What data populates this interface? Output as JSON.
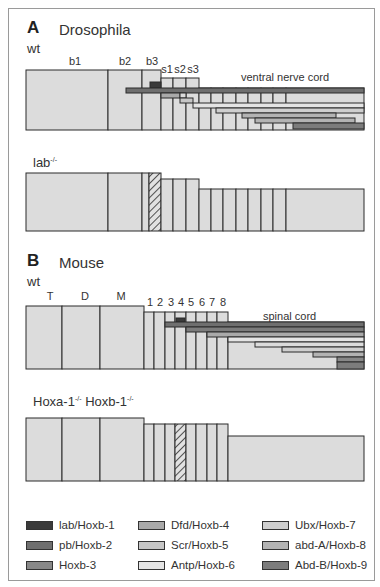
{
  "colors": {
    "segment_fill": "#dcdcdc",
    "outline": "#2b2b2b",
    "lab": "#3a3a3a",
    "pb": "#6f6f6f",
    "hoxb3": "#888888",
    "dfd": "#a9a9a9",
    "scr": "#c6c6c6",
    "antp": "#e4e4e4",
    "ubx": "#cfcfcf",
    "abdA": "#b3b3b3",
    "abdB": "#7c7c7c"
  },
  "panelA": {
    "letter": "A",
    "title": "Drosophila",
    "wt_label": "wt",
    "mutant_label": "lab",
    "mutant_sup": "-/-",
    "segment_labels": [
      "b1",
      "b2",
      "b3",
      "s1",
      "s2",
      "s3"
    ],
    "region_label": "ventral nerve cord"
  },
  "panelB": {
    "letter": "B",
    "title": "Mouse",
    "wt_label": "wt",
    "mutant_label_1": "Hoxa-1",
    "mutant_sup_1": "-/-",
    "mutant_label_2": "Hoxb-1",
    "mutant_sup_2": "-/-",
    "segment_labels": [
      "T",
      "D",
      "M",
      "1",
      "2",
      "3",
      "4",
      "5",
      "6",
      "7",
      "8"
    ],
    "region_label": "spinal cord"
  },
  "legend": [
    {
      "label": "lab/Hoxb-1",
      "color": "#3a3a3a"
    },
    {
      "label": "pb/Hoxb-2",
      "color": "#6f6f6f"
    },
    {
      "label": "Hoxb-3",
      "color": "#888888"
    },
    {
      "label": "Dfd/Hoxb-4",
      "color": "#a9a9a9"
    },
    {
      "label": "Scr/Hoxb-5",
      "color": "#c6c6c6"
    },
    {
      "label": "Antp/Hoxb-6",
      "color": "#e4e4e4"
    },
    {
      "label": "Ubx/Hoxb-7",
      "color": "#cfcfcf"
    },
    {
      "label": "abd-A/Hoxb-8",
      "color": "#b3b3b3"
    },
    {
      "label": "Abd-B/Hoxb-9",
      "color": "#7c7c7c"
    }
  ]
}
